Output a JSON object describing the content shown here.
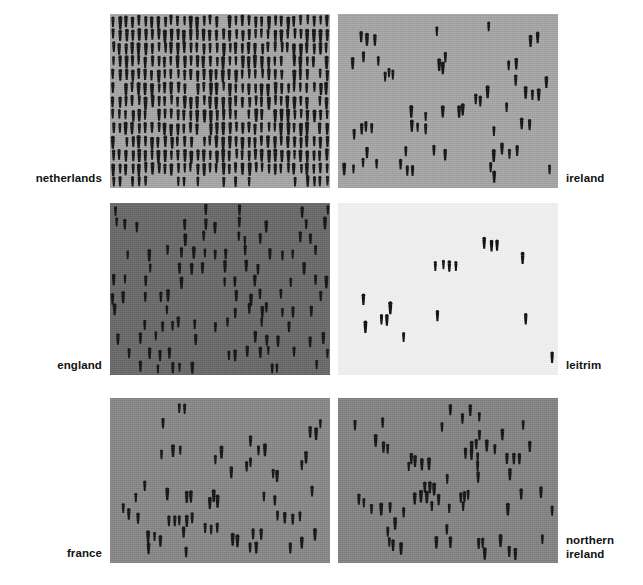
{
  "figure": {
    "type": "isotype-density-small-multiples",
    "width": 643,
    "height": 585,
    "page_background": "#ffffff",
    "pictogram_color": "#121212",
    "label_color": "#121212"
  },
  "chart_data": {
    "type": "scatter",
    "title": "",
    "subtitle": "",
    "xlabel": "",
    "ylabel": "",
    "units": "one pictogram = one unit of population per unit area",
    "grid": false,
    "legend": "none",
    "encoding": "density of human pictograms per panel",
    "panel_count": 6,
    "panel_layout": "3 rows x 2 columns",
    "categories": [
      "netherlands",
      "ireland",
      "england",
      "leitrim",
      "france",
      "northern ireland"
    ],
    "values": [
      390,
      60,
      122,
      17,
      62,
      71
    ],
    "series": [
      {
        "name": "pictogram count per panel",
        "values": [
          390,
          60,
          122,
          17,
          62,
          71
        ]
      }
    ],
    "panels": [
      {
        "label": "netherlands",
        "label_side": "left",
        "row": 1,
        "column": 1,
        "background": "#a9a9a9",
        "pictogram_count": 390,
        "density_rank": 1,
        "density_note": "most dense - near continuous rows of figures"
      },
      {
        "label": "ireland",
        "label_side": "right",
        "row": 1,
        "column": 2,
        "background": "#a8a8a8",
        "pictogram_count": 60,
        "density_rank": 5,
        "density_note": "sparse scatter"
      },
      {
        "label": "england",
        "label_side": "left",
        "row": 2,
        "column": 1,
        "background": "#6a6a6a",
        "pictogram_count": 122,
        "density_rank": 2,
        "density_note": "moderately dense, darkest panel"
      },
      {
        "label": "leitrim",
        "label_side": "right",
        "row": 2,
        "column": 2,
        "background": "#f2f2f2",
        "pictogram_count": 17,
        "density_rank": 6,
        "density_note": "least dense - lightest panel"
      },
      {
        "label": "france",
        "label_side": "left",
        "row": 3,
        "column": 1,
        "background": "#898989",
        "pictogram_count": 62,
        "density_rank": 4,
        "density_note": "sparse scatter"
      },
      {
        "label": "northern\nireland",
        "label_side": "right",
        "row": 3,
        "column": 2,
        "background": "#858585",
        "pictogram_count": 71,
        "density_rank": 3,
        "density_note": "sparse to moderate scatter"
      }
    ]
  },
  "labels": {
    "netherlands": "netherlands",
    "ireland": "ireland",
    "england": "england",
    "leitrim": "leitrim",
    "france": "france",
    "northern_ireland": "northern\nireland"
  }
}
